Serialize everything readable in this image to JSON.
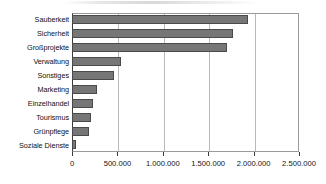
{
  "chart_data": {
    "type": "bar",
    "orientation": "horizontal",
    "title": "",
    "xlabel": "",
    "ylabel": "",
    "categories": [
      "Sauberkeit",
      "Sicherheit",
      "Großprojekte",
      "Verwaltung",
      "Sonstiges",
      "Marketing",
      "Einzelhandel",
      "Tourismus",
      "Grünpflege",
      "Soziale Dienste"
    ],
    "values": [
      1940000,
      1770000,
      1710000,
      540000,
      460000,
      280000,
      235000,
      210000,
      188000,
      42000
    ],
    "xlim": [
      0,
      2500000
    ],
    "xticks": [
      0,
      500000,
      1000000,
      1500000,
      2000000,
      2500000
    ],
    "xtick_labels": [
      "0",
      "500.000",
      "1.000.000",
      "1.500.000",
      "2.000.000",
      "2.500.000"
    ],
    "grid": true,
    "grid_axis": "x",
    "legend": false,
    "bar_color": "#767676",
    "bar_edge_color": "#4a4a4a",
    "axis_color": "#3a3a3a",
    "grid_color": "#b9b9b9",
    "number_format": "de-DE"
  }
}
